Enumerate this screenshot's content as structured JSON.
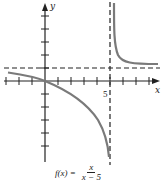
{
  "diagram": {
    "type": "function-graph",
    "function": {
      "lhs": "f(x) =",
      "numerator": "x",
      "denominator": "x − 5"
    },
    "axes": {
      "x_label": "x",
      "y_label": "y"
    },
    "tick_labels": {
      "x_5": "5"
    },
    "asymptotes": {
      "vertical": "x = 5",
      "horizontal": "y = 1"
    },
    "colors": {
      "curve": "#7a7a7a",
      "axes": "#222222",
      "asymptote": "#222222"
    }
  }
}
